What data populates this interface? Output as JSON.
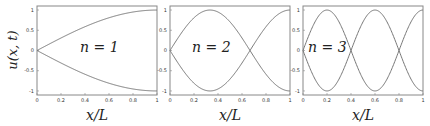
{
  "chart_data": [
    {
      "type": "line",
      "title": "",
      "annotation": "n = 1",
      "xlabel": "x/L",
      "ylabel": "u(x, t)",
      "xlim": [
        0,
        1
      ],
      "ylim": [
        -1.1,
        1.1
      ],
      "xticks": [
        "0",
        "0.2",
        "0.4",
        "0.6",
        "0.8",
        "1"
      ],
      "yticks": [
        "1",
        "0.5",
        "0",
        "-0.5",
        "-1"
      ],
      "grid": false,
      "series": [
        {
          "name": "+sin(1·pi·x/2L)",
          "expr": "sin(pi*x/2)",
          "x": [
            0,
            0.2,
            0.4,
            0.6,
            0.8,
            1.0
          ],
          "values": [
            0,
            0.31,
            0.59,
            0.81,
            0.95,
            1.0
          ]
        },
        {
          "name": "-sin(1·pi·x/2L)",
          "expr": "-sin(pi*x/2)",
          "x": [
            0,
            0.2,
            0.4,
            0.6,
            0.8,
            1.0
          ],
          "values": [
            0,
            -0.31,
            -0.59,
            -0.81,
            -0.95,
            -1.0
          ]
        }
      ]
    },
    {
      "type": "line",
      "title": "",
      "annotation": "n = 2",
      "xlabel": "x/L",
      "ylabel": "",
      "xlim": [
        0,
        1
      ],
      "ylim": [
        -1.1,
        1.1
      ],
      "xticks": [
        "0",
        "0.2",
        "0.4",
        "0.6",
        "0.8",
        "1"
      ],
      "yticks": [
        "1",
        "0.5",
        "0",
        "-0.5",
        "-1"
      ],
      "grid": false,
      "series": [
        {
          "name": "+sin(3·pi·x/2L)",
          "expr": "sin(3*pi*x/2)",
          "x": [
            0,
            0.2,
            0.333,
            0.4,
            0.6,
            0.667,
            0.8,
            1.0
          ],
          "values": [
            0,
            0.81,
            1.0,
            0.95,
            -0.31,
            0,
            -0.59,
            -1.0
          ]
        },
        {
          "name": "-sin(3·pi·x/2L)",
          "expr": "-sin(3*pi*x/2)",
          "x": [
            0,
            0.2,
            0.333,
            0.4,
            0.6,
            0.667,
            0.8,
            1.0
          ],
          "values": [
            0,
            -0.81,
            -1.0,
            -0.95,
            0.31,
            0,
            0.59,
            1.0
          ]
        }
      ]
    },
    {
      "type": "line",
      "title": "",
      "annotation": "n = 3",
      "xlabel": "x/L",
      "ylabel": "",
      "xlim": [
        0,
        1
      ],
      "ylim": [
        -1.1,
        1.1
      ],
      "xticks": [
        "0",
        "0.2",
        "0.4",
        "0.6",
        "0.8",
        "1"
      ],
      "yticks": [
        "1",
        "0.5",
        "0",
        "-0.5",
        "-1"
      ],
      "grid": false,
      "series": [
        {
          "name": "+sin(5·pi·x/2L)",
          "expr": "sin(5*pi*x/2)",
          "x": [
            0,
            0.2,
            0.4,
            0.6,
            0.8,
            1.0
          ],
          "values": [
            0,
            1.0,
            0,
            -1.0,
            0,
            1.0
          ]
        },
        {
          "name": "-sin(5·pi·x/2L)",
          "expr": "-sin(5*pi*x/2)",
          "x": [
            0,
            0.2,
            0.4,
            0.6,
            0.8,
            1.0
          ],
          "values": [
            0,
            -1.0,
            0,
            1.0,
            0,
            -1.0
          ]
        }
      ]
    }
  ],
  "panels": [
    {
      "k": 1,
      "label": "n = 1",
      "xlabel": "x/L",
      "ylabel": "u(x, t)"
    },
    {
      "k": 3,
      "label": "n = 2",
      "xlabel": "x/L",
      "ylabel": ""
    },
    {
      "k": 5,
      "label": "n = 3",
      "xlabel": "x/L",
      "ylabel": ""
    }
  ],
  "colors": {
    "curve": "#777777",
    "frame": "#888888",
    "text": "#222222"
  }
}
